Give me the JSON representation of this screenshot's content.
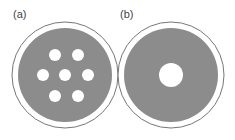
{
  "panels": [
    {
      "label": "(a)",
      "description": "Disk with seven small holes in hexagonal arrangement",
      "center": [
        65,
        75
      ],
      "outer_radius": 53,
      "disk_radius": 47,
      "holes": [
        {
          "cx": 55,
          "cy": 55,
          "r": 6
        },
        {
          "cx": 78,
          "cy": 55,
          "r": 6
        },
        {
          "cx": 43,
          "cy": 75,
          "r": 6
        },
        {
          "cx": 65,
          "cy": 75,
          "r": 6
        },
        {
          "cx": 88,
          "cy": 75,
          "r": 6
        },
        {
          "cx": 55,
          "cy": 96,
          "r": 6
        },
        {
          "cx": 78,
          "cy": 96,
          "r": 6
        }
      ]
    },
    {
      "label": "(b)",
      "description": "Disk with one large central hole",
      "center": [
        171,
        75
      ],
      "outer_radius": 53,
      "disk_radius": 47,
      "holes": [
        {
          "cx": 171,
          "cy": 75,
          "r": 12
        }
      ]
    }
  ],
  "colors": {
    "disk_fill": "#8c8c8c",
    "outer_ring_stroke": "#777777",
    "hole_fill": "#ffffff",
    "background": "#ffffff",
    "label": "#444444"
  }
}
